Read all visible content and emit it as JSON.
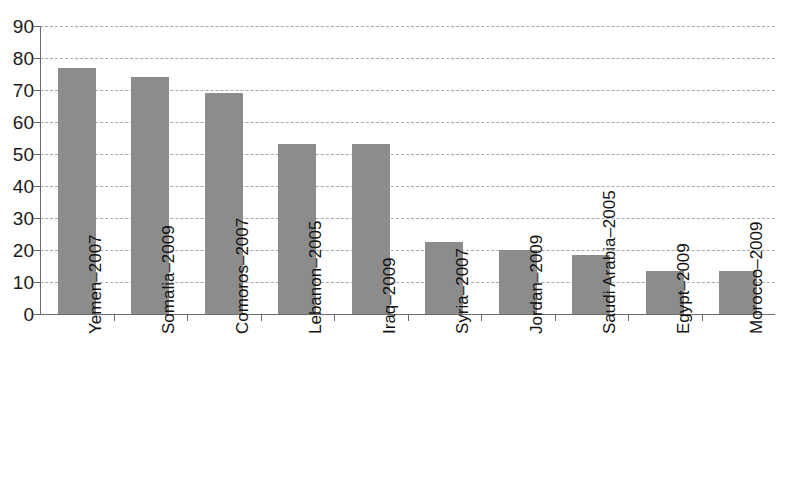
{
  "chart_data": {
    "type": "bar",
    "title": "",
    "subtitle": "",
    "xlabel": "",
    "ylabel": "",
    "ylim": [
      0,
      90
    ],
    "ytick_step": 10,
    "yticks": [
      90,
      80,
      70,
      60,
      50,
      40,
      30,
      20,
      10,
      0
    ],
    "grid": true,
    "grid_axis": "y",
    "legend": false,
    "legend_position": "none",
    "orientation": "vertical",
    "categories": [
      "Yemen–2007",
      "Somalia–2009",
      "Comoros–2007",
      "Lebanon–2005",
      "Iraq–2009",
      "Syria–2007",
      "Jordan–2009",
      "Saudi Arabia–2005",
      "Egypt–2009",
      "Morocco–2009"
    ],
    "values": [
      77,
      74,
      69,
      53,
      53,
      22.5,
      20,
      18.5,
      13.5,
      13.5
    ],
    "series": [
      {
        "name": "",
        "values": [
          77,
          74,
          69,
          53,
          53,
          22.5,
          20,
          18.5,
          13.5,
          13.5
        ]
      }
    ],
    "colors": {
      "bar_fill": "#8c8c8c",
      "gridline": "#a8a8a8",
      "axis": "#6b6b6b",
      "text": "#121212",
      "background": "#ffffff"
    }
  }
}
